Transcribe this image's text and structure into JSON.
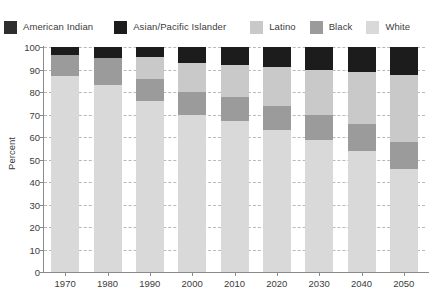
{
  "chart_data": {
    "type": "bar",
    "stacked": true,
    "title": "",
    "xlabel": "",
    "ylabel": "Percent",
    "ylim": [
      0,
      100
    ],
    "ytick_step": 10,
    "grid": true,
    "legend_position": "top",
    "categories": [
      "1970",
      "1980",
      "1990",
      "2000",
      "2010",
      "2020",
      "2030",
      "2040",
      "2050"
    ],
    "series": [
      {
        "name": "White",
        "color": "#d9d9d9",
        "values": [
          87.0,
          83.0,
          76.0,
          70.0,
          67.0,
          63.0,
          58.5,
          54.0,
          46.0
        ]
      },
      {
        "name": "Black",
        "color": "#9b9b9b",
        "values": [
          9.5,
          12.0,
          10.0,
          10.0,
          11.0,
          11.0,
          11.5,
          12.0,
          12.0
        ]
      },
      {
        "name": "Latino",
        "color": "#c9c9c9",
        "values": [
          0.0,
          0.0,
          9.5,
          13.0,
          14.0,
          17.0,
          20.0,
          23.0,
          29.5
        ]
      },
      {
        "name": "Asian/Pacific Islander",
        "color": "#1c1c1c",
        "values": [
          3.5,
          5.0,
          4.5,
          7.0,
          8.0,
          9.0,
          10.0,
          11.0,
          12.5
        ]
      },
      {
        "name": "American Indian",
        "color": "#2e2e2e",
        "values": [
          0.0,
          0.0,
          0.0,
          0.0,
          0.0,
          0.0,
          0.0,
          0.0,
          0.0
        ]
      }
    ],
    "ytick_labels": [
      "0",
      "10",
      "20",
      "30",
      "40",
      "50",
      "60",
      "70",
      "80",
      "90",
      "100"
    ]
  },
  "legend": {
    "items": [
      {
        "label": "American Indian",
        "color": "#2e2e2e"
      },
      {
        "label": "Asian/Pacific Islander",
        "color": "#1c1c1c"
      },
      {
        "label": "Latino",
        "color": "#c9c9c9"
      },
      {
        "label": "Black",
        "color": "#9b9b9b"
      },
      {
        "label": "White",
        "color": "#d9d9d9"
      }
    ]
  },
  "axes": {
    "y_title": "Percent"
  }
}
